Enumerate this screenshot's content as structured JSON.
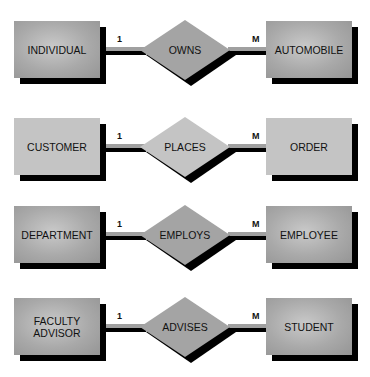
{
  "diagram": {
    "type": "entity-relationship examples",
    "rows": [
      {
        "left_entity": "INDIVIDUAL",
        "relationship": "OWNS",
        "right_entity": "AUTOMOBILE",
        "left_card": "1",
        "right_card": "M",
        "style": "dark"
      },
      {
        "left_entity": "CUSTOMER",
        "relationship": "PLACES",
        "right_entity": "ORDER",
        "left_card": "1",
        "right_card": "M",
        "style": "light"
      },
      {
        "left_entity": "DEPARTMENT",
        "relationship": "EMPLOYS",
        "right_entity": "EMPLOYEE",
        "left_card": "1",
        "right_card": "M",
        "style": "dark"
      },
      {
        "left_entity": "FACULTY\nADVISOR",
        "relationship": "ADVISES",
        "right_entity": "STUDENT",
        "left_card": "1",
        "right_card": "M",
        "style": "dark"
      }
    ],
    "colors": {
      "entity_fill": "#a9a9a9",
      "light_fill": "#c4c4c4",
      "shadow": "#000000",
      "connector": "#a0a0a0"
    }
  }
}
